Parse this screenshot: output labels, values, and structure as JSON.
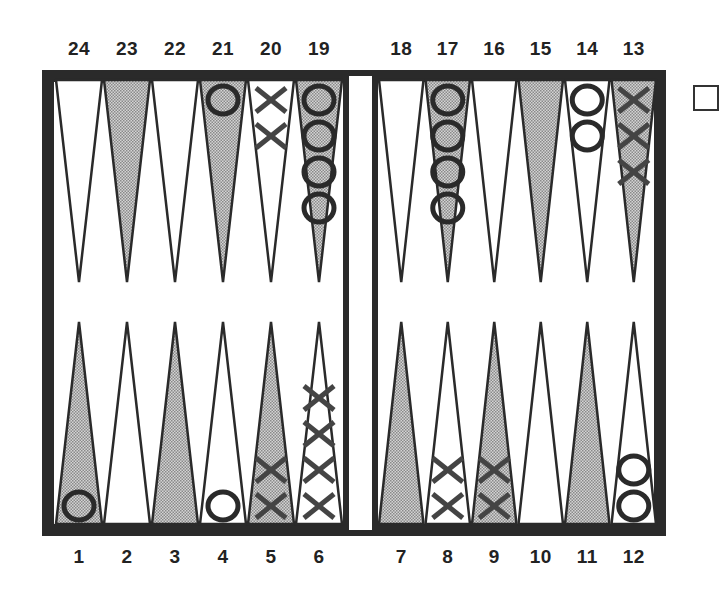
{
  "board": {
    "title": "Backgammon position",
    "top_labels": [
      "24",
      "23",
      "22",
      "21",
      "20",
      "19",
      "18",
      "17",
      "16",
      "15",
      "14",
      "13"
    ],
    "bottom_labels": [
      "1",
      "2",
      "3",
      "4",
      "5",
      "6",
      "7",
      "8",
      "9",
      "10",
      "11",
      "12"
    ],
    "colors": {
      "frame": "#2a2a2a",
      "shaded_point": "#b8b8b8",
      "light_point": "#ffffff",
      "checker_stroke": "#2a2a2a",
      "x_stroke": "#444444"
    },
    "points": [
      {
        "point": 1,
        "checkers": "O",
        "count": 1
      },
      {
        "point": 2,
        "checkers": "",
        "count": 0
      },
      {
        "point": 3,
        "checkers": "",
        "count": 0
      },
      {
        "point": 4,
        "checkers": "O",
        "count": 1
      },
      {
        "point": 5,
        "checkers": "X",
        "count": 2
      },
      {
        "point": 6,
        "checkers": "X",
        "count": 4
      },
      {
        "point": 7,
        "checkers": "",
        "count": 0
      },
      {
        "point": 8,
        "checkers": "X",
        "count": 2
      },
      {
        "point": 9,
        "checkers": "X",
        "count": 2
      },
      {
        "point": 10,
        "checkers": "",
        "count": 0
      },
      {
        "point": 11,
        "checkers": "",
        "count": 0
      },
      {
        "point": 12,
        "checkers": "O",
        "count": 2
      },
      {
        "point": 13,
        "checkers": "X",
        "count": 3
      },
      {
        "point": 14,
        "checkers": "O",
        "count": 2
      },
      {
        "point": 15,
        "checkers": "",
        "count": 0
      },
      {
        "point": 16,
        "checkers": "",
        "count": 0
      },
      {
        "point": 17,
        "checkers": "O",
        "count": 4
      },
      {
        "point": 18,
        "checkers": "",
        "count": 0
      },
      {
        "point": 19,
        "checkers": "O",
        "count": 4
      },
      {
        "point": 20,
        "checkers": "X",
        "count": 2
      },
      {
        "point": 21,
        "checkers": "O",
        "count": 1
      },
      {
        "point": 22,
        "checkers": "",
        "count": 0
      },
      {
        "point": 23,
        "checkers": "",
        "count": 0
      },
      {
        "point": 24,
        "checkers": "",
        "count": 0
      }
    ],
    "doubling_cube": {
      "value": ""
    }
  }
}
